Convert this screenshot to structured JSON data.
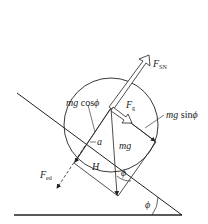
{
  "diagram": {
    "type": "free-body diagram",
    "colors": {
      "line": "#222222",
      "background": "#ffffff"
    },
    "labels": {
      "f_sn": {
        "main": "F",
        "sub": "SN"
      },
      "f_g": {
        "main": "F",
        "sub": "g"
      },
      "mg_cos": {
        "main": "mg",
        "fn": "cos",
        "angle": "ϕ"
      },
      "mg_sin": {
        "main": "mg",
        "fn": "sin",
        "angle": "ϕ"
      },
      "mg": "mg",
      "a": "a",
      "H": "H",
      "f_ed": {
        "main": "F",
        "sub": "ed"
      },
      "phi_inner": "ϕ",
      "phi_base": "ϕ"
    }
  }
}
